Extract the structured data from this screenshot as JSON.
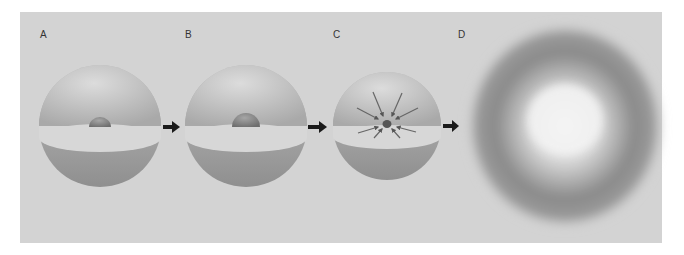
{
  "figure": {
    "panels": [
      {
        "id": "A",
        "label": "A",
        "description": "sphere with small core"
      },
      {
        "id": "B",
        "label": "B",
        "description": "sphere with larger core"
      },
      {
        "id": "C",
        "label": "C",
        "description": "sphere collapsing inward (arrows toward center)"
      },
      {
        "id": "D",
        "label": "D",
        "description": "diffuse explosion cloud"
      }
    ],
    "arrows": [
      "A-to-B",
      "B-to-C",
      "C-to-D"
    ],
    "colors": {
      "background": "#d3d3d3",
      "sphere": "#b8b8b8",
      "core": "#8a8a8a",
      "arrow": "#1a1a1a"
    }
  }
}
